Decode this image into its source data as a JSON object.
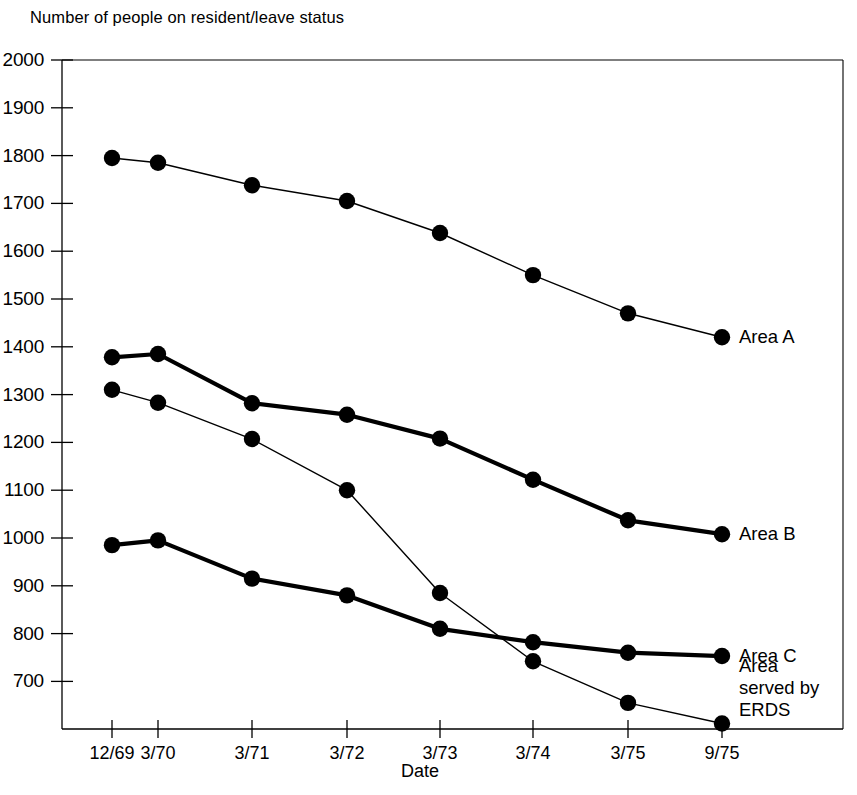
{
  "chart_data": {
    "type": "line",
    "title": "Number of people on resident/leave status",
    "xlabel": "Date",
    "ylabel": "",
    "categories": [
      "12/69",
      "3/70",
      "3/71",
      "3/72",
      "3/73",
      "3/74",
      "3/75",
      "9/75"
    ],
    "ytick_labels": [
      "2000",
      "1900",
      "1800",
      "1700",
      "1600",
      "1500",
      "1400",
      "1300",
      "1200",
      "1100",
      "1000",
      "900",
      "800",
      "700"
    ],
    "ytick_values": [
      2000,
      1900,
      1800,
      1700,
      1600,
      1500,
      1400,
      1300,
      1200,
      1100,
      1000,
      900,
      800,
      700
    ],
    "ylim": [
      600,
      2000
    ],
    "grid": false,
    "legend_position": "right-inline",
    "marker": "filled-circle",
    "series": [
      {
        "name": "Area A",
        "label": "Area A",
        "line_width": 1.4,
        "color": "#000000",
        "values": [
          1795,
          1785,
          1738,
          1705,
          1638,
          1550,
          1470,
          1420
        ]
      },
      {
        "name": "Area B",
        "label": "Area B",
        "line_width": 4.2,
        "color": "#000000",
        "values": [
          1378,
          1385,
          1282,
          1258,
          1208,
          1122,
          1037,
          1008
        ]
      },
      {
        "name": "Area C",
        "label": "Area C",
        "line_width": 4.2,
        "color": "#000000",
        "values": [
          985,
          995,
          915,
          880,
          810,
          782,
          760,
          753
        ]
      },
      {
        "name": "Area served by ERDS",
        "label": "Area served by ERDS",
        "label_lines": [
          "Area",
          "served by",
          "ERDS"
        ],
        "line_width": 1.4,
        "color": "#000000",
        "values": [
          1310,
          1283,
          1207,
          1100,
          885,
          742,
          655,
          612
        ]
      }
    ]
  },
  "labels": {
    "title": "Number of people on resident/leave status",
    "xaxis": "Date",
    "area_a": "Area A",
    "area_b": "Area B",
    "area_c": "Area C",
    "erds_line1": "Area",
    "erds_line2": "served by",
    "erds_line3": "ERDS"
  },
  "axis_ticks": {
    "y": [
      "2000",
      "1900",
      "1800",
      "1700",
      "1600",
      "1500",
      "1400",
      "1300",
      "1200",
      "1100",
      "1000",
      "900",
      "800",
      "700"
    ],
    "x": [
      "12/69",
      "3/70",
      "3/71",
      "3/72",
      "3/73",
      "3/74",
      "3/75",
      "9/75"
    ]
  },
  "colors": {
    "axis": "#000000",
    "series": "#000000",
    "background": "#ffffff"
  }
}
